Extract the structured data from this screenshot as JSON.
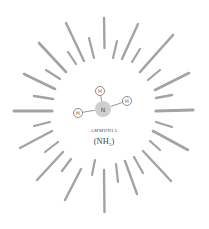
{
  "diagram": {
    "title": "AMMONIA",
    "formula": {
      "prefix": "(NH",
      "subscript": "3",
      "suffix": ")"
    },
    "colors": {
      "ray": "#a3a3a3",
      "nitrogen": "#cfcfcf",
      "hydrogen_fill": "#ffffff",
      "hydrogen_stroke": "#6e6e6e",
      "bond": "#8c8c8c",
      "text": "#444444"
    },
    "molecule": {
      "central_atom": {
        "symbol": "N",
        "cx": 103,
        "cy": 109,
        "r": 8
      },
      "atoms": [
        {
          "symbol": "H",
          "cx": 100,
          "cy": 91,
          "r": 4.5
        },
        {
          "symbol": "H",
          "cx": 127,
          "cy": 101,
          "r": 4.5
        },
        {
          "symbol": "H",
          "cx": 78,
          "cy": 113,
          "r": 4.5
        }
      ]
    },
    "rays": [
      {
        "d": "M104 18 L104.5 48",
        "w": 2.4
      },
      {
        "d": "M89 38 L94 58",
        "w": 2.2
      },
      {
        "d": "M117 41 L113 58",
        "w": 2.2
      },
      {
        "d": "M66 23 L84 61",
        "w": 2.4
      },
      {
        "d": "M138 24 L122 59",
        "w": 2.4
      },
      {
        "d": "M68 52 L76 64",
        "w": 2.2
      },
      {
        "d": "M140 49 L132 62",
        "w": 2.2
      },
      {
        "d": "M39 43 L66 72",
        "w": 2.6
      },
      {
        "d": "M173 35 L140 72",
        "w": 2.6
      },
      {
        "d": "M46 70 L60 79",
        "w": 2.2
      },
      {
        "d": "M160 70 L148 80",
        "w": 2.2
      },
      {
        "d": "M24 74 L55 89",
        "w": 2.6
      },
      {
        "d": "M189 73 L155 90",
        "w": 2.6
      },
      {
        "d": "M34 96 L53 99",
        "w": 2.4
      },
      {
        "d": "M156 98 L172 95",
        "w": 2.4
      },
      {
        "d": "M14 111 L52 111",
        "w": 3
      },
      {
        "d": "M156 111 L193 110",
        "w": 3.2
      },
      {
        "d": "M34 126 L50 122",
        "w": 2.2
      },
      {
        "d": "M156 122 L172 127",
        "w": 2.2
      },
      {
        "d": "M20 148 L52 131",
        "w": 2.4
      },
      {
        "d": "M153 131 L188 150",
        "w": 2.6
      },
      {
        "d": "M45 152 L58 142",
        "w": 2.2
      },
      {
        "d": "M150 141 L160 150",
        "w": 2.2
      },
      {
        "d": "M37 180 L63 152",
        "w": 2.4
      },
      {
        "d": "M143 151 L171 181",
        "w": 2.4
      },
      {
        "d": "M62 171 L71 159",
        "w": 2.2
      },
      {
        "d": "M134 157 L143 173",
        "w": 2.2
      },
      {
        "d": "M65 200 L81 169",
        "w": 2.4
      },
      {
        "d": "M125 161 L137 194",
        "w": 2.4
      },
      {
        "d": "M92 175 L95 160",
        "w": 2.2
      },
      {
        "d": "M116 164 L118 182",
        "w": 2.2
      },
      {
        "d": "M104 170 L104.5 212",
        "w": 2.4
      }
    ]
  }
}
